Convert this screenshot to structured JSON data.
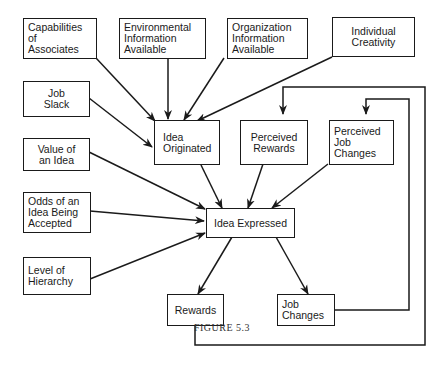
{
  "caption": "FIGURE 5.3",
  "nodes": {
    "capabilities": "Capabilities\nof\nAssociates",
    "environmental": "Environmental\nInformation\nAvailable",
    "organization": "Organization\nInformation\nAvailable",
    "creativity": "Individual\nCreativity",
    "job_slack": "Job\nSlack",
    "idea_originated": "Idea\nOriginated",
    "perceived_rewards": "Perceived\nRewards",
    "perceived_job_changes": "Perceived\nJob\nChanges",
    "value_of_idea": "Value of\nan Idea",
    "odds_accepted": "Odds of an\nIdea Being\nAccepted",
    "idea_expressed": "Idea Expressed",
    "level_hierarchy": "Level of\nHierarchy",
    "rewards": "Rewards",
    "job_changes": "Job\nChanges"
  },
  "edges": [
    {
      "from": "Capabilities of Associates",
      "to": "Idea Originated"
    },
    {
      "from": "Environmental Information Available",
      "to": "Idea Originated"
    },
    {
      "from": "Organization Information Available",
      "to": "Idea Originated"
    },
    {
      "from": "Individual Creativity",
      "to": "Idea Originated"
    },
    {
      "from": "Job Slack",
      "to": "Idea Originated"
    },
    {
      "from": "Idea Originated",
      "to": "Idea Expressed"
    },
    {
      "from": "Perceived Rewards",
      "to": "Idea Expressed"
    },
    {
      "from": "Perceived Job Changes",
      "to": "Idea Expressed"
    },
    {
      "from": "Value of an Idea",
      "to": "Idea Expressed"
    },
    {
      "from": "Odds of an Idea Being Accepted",
      "to": "Idea Expressed"
    },
    {
      "from": "Level of Hierarchy",
      "to": "Idea Expressed"
    },
    {
      "from": "Idea Expressed",
      "to": "Rewards"
    },
    {
      "from": "Idea Expressed",
      "to": "Job Changes"
    },
    {
      "from": "Rewards",
      "to": "Perceived Rewards"
    },
    {
      "from": "Job Changes",
      "to": "Perceived Job Changes"
    }
  ]
}
